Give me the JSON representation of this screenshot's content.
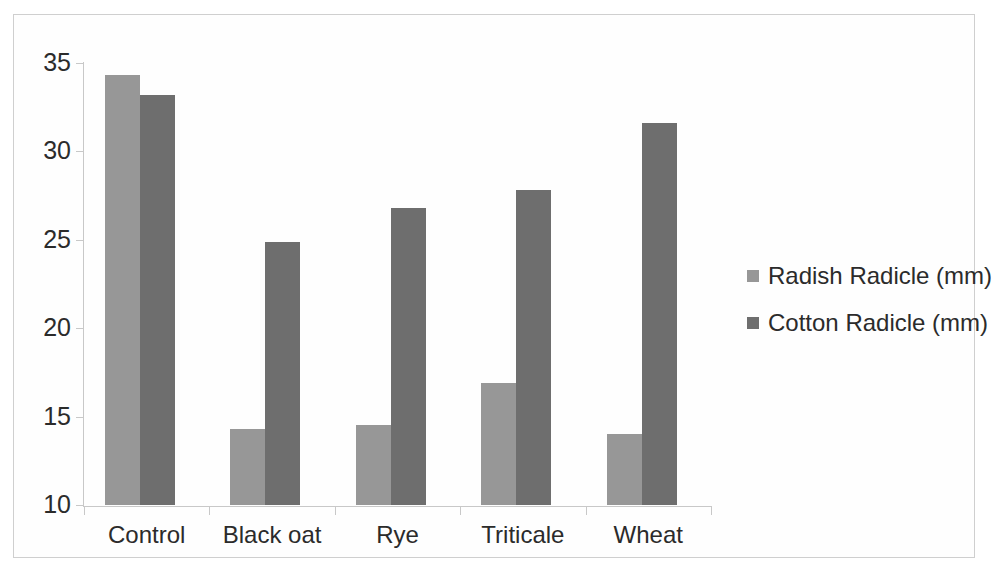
{
  "chart_data": {
    "type": "bar",
    "title": "",
    "subtitle": "",
    "xlabel": "",
    "ylabel": "",
    "categories": [
      "Control",
      "Black oat",
      "Rye",
      "Triticale",
      "Wheat"
    ],
    "series": [
      {
        "name": "Radish Radicle (mm)",
        "color": "#979797",
        "values": [
          34.3,
          14.3,
          14.5,
          16.9,
          14.0
        ]
      },
      {
        "name": "Cotton Radicle (mm)",
        "color": "#6e6e6e",
        "values": [
          33.2,
          24.9,
          26.8,
          27.8,
          31.6
        ]
      }
    ],
    "ylim": [
      10,
      35
    ],
    "ytick_labels": [
      "35",
      "30",
      "25",
      "20",
      "15",
      "10"
    ],
    "ytick_values": [
      35,
      30,
      25,
      20,
      15,
      10
    ],
    "grid": false,
    "legend_position": "right",
    "axis_color": "#c8c8c8",
    "text_color": "#2b2b2b",
    "background": "#ffffff",
    "frame_border_color": "#cfcfcf"
  }
}
